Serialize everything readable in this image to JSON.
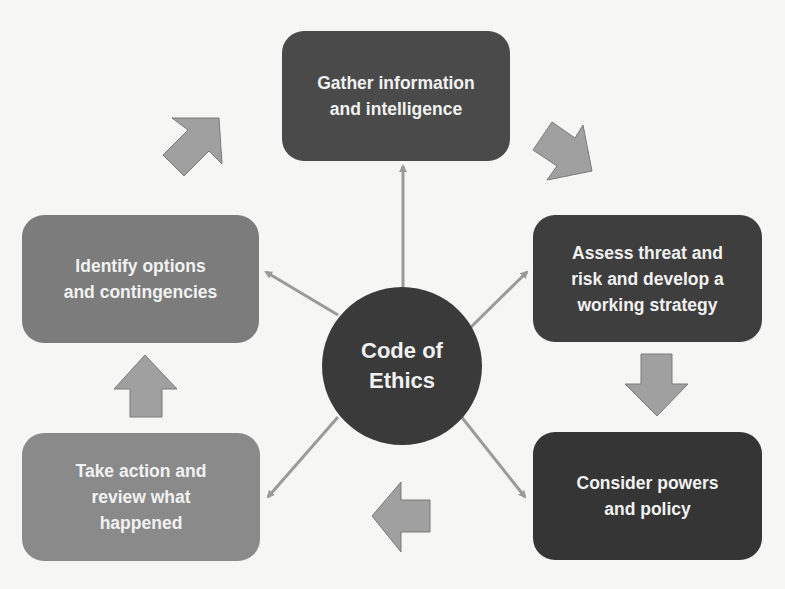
{
  "diagram": {
    "type": "cycle-with-hub",
    "hub": {
      "label": "Code of\nEthics",
      "color": "#3a3a3a"
    },
    "steps": [
      {
        "id": "gather",
        "label": "Gather information\nand intelligence",
        "color": "#4a4a4a"
      },
      {
        "id": "assess",
        "label": "Assess threat and\nrisk and develop a\nworking strategy",
        "color": "#3e3e3e"
      },
      {
        "id": "consider",
        "label": "Consider powers\nand policy",
        "color": "#353535"
      },
      {
        "id": "action",
        "label": "Take action and\nreview what\nhappened",
        "color": "#8a8a8a"
      },
      {
        "id": "identify",
        "label": "Identify options\nand contingencies",
        "color": "#7c7c7c"
      }
    ],
    "connector_color": "#9a9a9a",
    "block_arrow_color": "#a0a0a0",
    "block_arrow_outline": "#7a7a7a"
  }
}
